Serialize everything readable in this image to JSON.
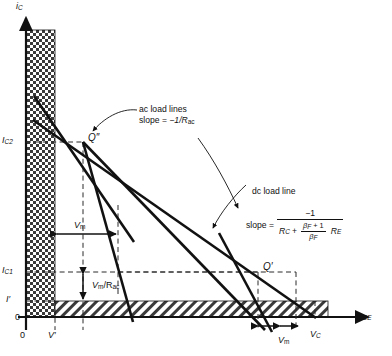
{
  "figure": {
    "kind": "transistor-load-line-diagram",
    "axes": {
      "y_label": "iC",
      "y_label_main": "i",
      "y_label_sub": "C",
      "x_label_main": "v",
      "x_label_sub": "CE",
      "origin_label_y": "0",
      "origin_label_x": "0"
    },
    "y_ticks": [
      {
        "id": "IC2",
        "main": "I",
        "sub": "C2",
        "y": 142
      },
      {
        "id": "IC1",
        "main": "I",
        "sub": "C1",
        "y": 272
      },
      {
        "id": "Iprime",
        "main": "I",
        "sub": "′",
        "y": 301
      }
    ],
    "x_ticks": [
      {
        "id": "Vprime",
        "main": "V",
        "sub": "′",
        "x": 55
      },
      {
        "id": "VC",
        "main": "V",
        "sub": "C",
        "x": 315
      }
    ],
    "operating_points": [
      {
        "id": "Qdoubleprime",
        "label": "Q″",
        "x": 83,
        "y": 142
      },
      {
        "id": "Qprime",
        "label": "Q′",
        "x": 258,
        "y": 272
      }
    ],
    "annotations": {
      "ac": {
        "line1": "ac load lines",
        "line2_prefix": "slope = ",
        "line2_value": "−1/R",
        "line2_sub": "ac"
      },
      "dc": {
        "title": "dc load line",
        "slope_word": "slope = ",
        "numerator": "−1",
        "denominator_first": "R",
        "denominator_first_sub": "C",
        "denominator_plus": "+",
        "ratio_num_main": "β",
        "ratio_num_sub": "F",
        "ratio_num_tail": " + 1",
        "ratio_den_main": "β",
        "ratio_den_sub": "F",
        "denominator_last": "R",
        "denominator_last_sub": "E"
      }
    },
    "measure_labels": [
      {
        "id": "Vm-left",
        "main": "V",
        "sub": "m",
        "x": 47,
        "y": 221,
        "orientation": "horizontal"
      },
      {
        "id": "Vm-over-Rac",
        "main": "V",
        "sub": "m",
        "tail": "/R",
        "tail_sub": "ac",
        "x": 95,
        "y": 283,
        "orientation": "vertical"
      },
      {
        "id": "Vm-bottom",
        "main": "V",
        "sub": "m",
        "x": 285,
        "y": 334,
        "orientation": "horizontal"
      }
    ],
    "colors": {
      "ink": "#111111",
      "hatch": "#3a3a3a",
      "dashed": "#2b2b2b",
      "background": "#ffffff"
    }
  }
}
